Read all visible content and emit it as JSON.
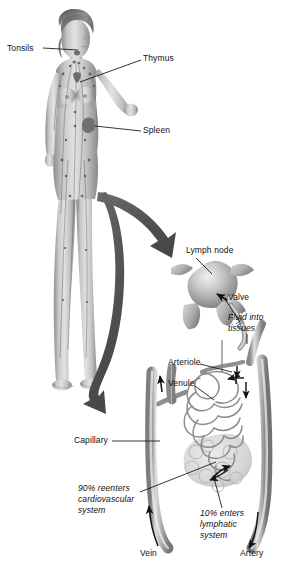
{
  "figure": {
    "background_color": "#ffffff",
    "ink_color": "#111111",
    "arrow_color": "#585858",
    "vessel_color": "#9a9a9a",
    "body_color": "#b9b9b9"
  },
  "labels": {
    "tonsils": "Tonsils",
    "thymus": "Thymus",
    "spleen": "Spleen",
    "lymph_node": "Lymph node",
    "valve": "Valve",
    "fluid_into_tissues_l1": "Fluid into",
    "fluid_into_tissues_l2": "tissues",
    "arteriole": "Arteriole",
    "venule": "Venule",
    "capillary": "Capillary",
    "reenters_l1": "90% reenters",
    "reenters_l2": "cardiovascular",
    "reenters_l3": "system",
    "enters_lymph_l1": "10% enters",
    "enters_lymph_l2": "lymphatic",
    "enters_lymph_l3": "system",
    "vein": "Vein",
    "artery": "Artery"
  },
  "annotations": {
    "percent_reenters_cardiovascular": "90%",
    "percent_enters_lymphatic": "10%"
  },
  "icons": {
    "body": "human-figure-icon",
    "node": "lymph-node-icon",
    "zoom_arrow_top": "curved-arrow-icon",
    "zoom_arrow_bottom": "curved-arrow-icon",
    "flow_arrow": "flow-arrow-icon"
  }
}
